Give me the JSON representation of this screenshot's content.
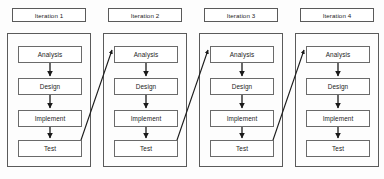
{
  "diagram": {
    "type": "process-flow",
    "layout": {
      "columns": 4,
      "column_width": 84,
      "column_gap": 12,
      "first_column_x": 7,
      "container_top": 33,
      "container_bottom": 167,
      "header_top": 8,
      "header_height": 14,
      "box_width": 64,
      "box_height": 17,
      "box_x_offset": 11,
      "box_tops": [
        46,
        78,
        110,
        140
      ]
    },
    "colors": {
      "background": "#fdfdfd",
      "box_fill": "#ffffff",
      "box_border": "#6a6a6a",
      "container_border": "#5a5a5a",
      "text": "#1c1c1c",
      "arrow": "#1a1a1a"
    },
    "iterations": [
      {
        "header": "Iteration 1",
        "phases": [
          "Analysis",
          "Design",
          "Implement",
          "Test"
        ],
        "has_feedback_arrow": true
      },
      {
        "header": "Iteration 2",
        "phases": [
          "Analysis",
          "Design",
          "Implement",
          "Test"
        ],
        "has_feedback_arrow": true
      },
      {
        "header": "Iteration 3",
        "phases": [
          "Analysis",
          "Design",
          "Implement",
          "Test"
        ],
        "has_feedback_arrow": true
      },
      {
        "header": "Iteration 4",
        "phases": [
          "Analysis",
          "Design",
          "Implement",
          "Test"
        ],
        "has_feedback_arrow": false
      }
    ]
  }
}
